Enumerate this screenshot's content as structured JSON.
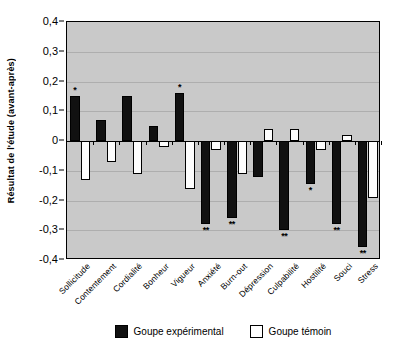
{
  "chart_data": {
    "type": "bar",
    "title": "",
    "xlabel": "",
    "ylabel": "Résultat de l'étude (avant-après)",
    "ylim": [
      -0.4,
      0.4
    ],
    "yticks": [
      "0,4",
      "0,3",
      "0,2",
      "0,1",
      "0",
      "-0,1",
      "-0,2",
      "-0,3",
      "-0,4"
    ],
    "ytick_values": [
      0.4,
      0.3,
      0.2,
      0.1,
      0,
      -0.1,
      -0.2,
      -0.3,
      -0.4
    ],
    "grid": true,
    "legend_position": "bottom",
    "categories": [
      "Sollicitude",
      "Contentement",
      "Cordialité",
      "Bonheur",
      "Vigueur",
      "Anxiété",
      "Burn-out",
      "Dépression",
      "Culpabilité",
      "Hostilité",
      "Souci",
      "Stress"
    ],
    "series": [
      {
        "name": "Goupe expérimental",
        "color": "#111111",
        "values": [
          0.15,
          0.07,
          0.15,
          0.05,
          0.16,
          -0.28,
          -0.26,
          -0.12,
          -0.3,
          -0.145,
          -0.28,
          -0.355
        ],
        "significance": [
          "*",
          "",
          "",
          "",
          "*",
          "**",
          "**",
          "",
          "**",
          "*",
          "**",
          "**"
        ]
      },
      {
        "name": "Goupe témoin",
        "color": "#ffffff",
        "values": [
          -0.13,
          -0.07,
          -0.11,
          -0.02,
          -0.16,
          -0.03,
          -0.11,
          0.04,
          0.04,
          -0.03,
          0.02,
          -0.19
        ],
        "significance": [
          "",
          "",
          "",
          "",
          "",
          "",
          "",
          "",
          "",
          "",
          "",
          ""
        ]
      }
    ]
  },
  "legend": {
    "items": [
      {
        "label": "Goupe expérimental",
        "swatch": "filled-black-square"
      },
      {
        "label": "Goupe témoin",
        "swatch": "open-white-square"
      }
    ]
  }
}
